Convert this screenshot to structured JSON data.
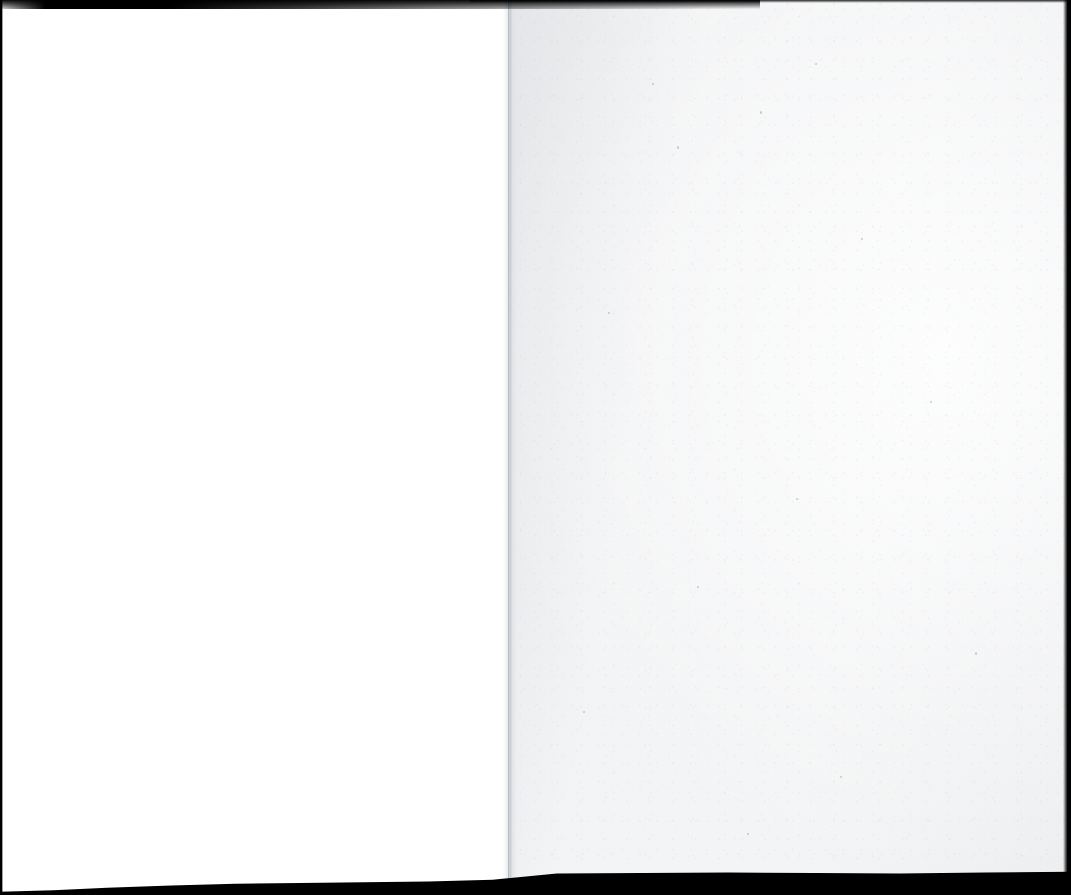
{
  "document": {
    "type": "scanned-book-spread",
    "content_text": "",
    "page_count_visible": 2,
    "canvas": {
      "width_px": 1071,
      "height_px": 895
    }
  },
  "spread": {
    "left_page": {
      "name": "verso",
      "text": "",
      "is_blank": true,
      "paper_color": "#ffffff",
      "left_px": 0,
      "width_px": 509
    },
    "right_page": {
      "name": "recto",
      "text": "",
      "is_blank": true,
      "paper_color": "#f3f4f5",
      "left_px": 509,
      "width_px": 562
    }
  },
  "gutter": {
    "name": "binding-gutter",
    "x_px": 508,
    "shadow_color": "#c4c8cd",
    "seam_color": "#b0b5bc"
  },
  "scan_artifacts": {
    "border_color": "#000000",
    "top_smudge": {
      "label": "top-edge-shadow",
      "height_px": 9,
      "extent_px": 760
    },
    "bottom_band": {
      "label": "bottom-edge-shadow",
      "height_px": 40
    },
    "left_edge": {
      "label": "left-edge-shadow",
      "width_px": 3
    },
    "right_edge": {
      "label": "right-edge-shadow",
      "width_px": 8
    }
  },
  "accessibility": {
    "alt_text": "Scan of an open book showing two facing blank pages with dark scanner borders along the top, bottom, left and right edges."
  }
}
